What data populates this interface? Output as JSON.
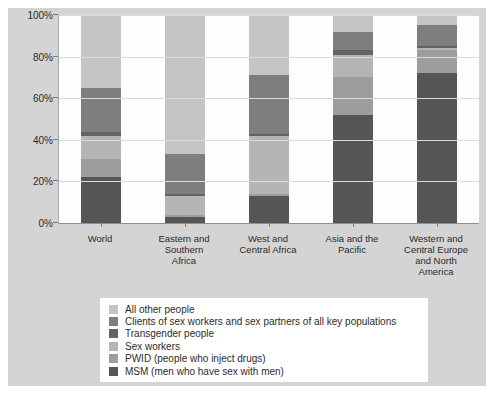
{
  "figure": {
    "background": "#d4d4d4",
    "plot_background": "#fdfdfd",
    "gridline_color": "#dcdcdc",
    "axis_color": "#8f8f8f",
    "text_color": "#2b2b2b",
    "legend_background": "#ffffff"
  },
  "chart_data": {
    "type": "bar",
    "subtype": "stacked-100-percent",
    "title": "",
    "xlabel": "",
    "ylabel": "",
    "ylim": [
      0,
      100
    ],
    "grid": true,
    "legend_position": "bottom",
    "y_ticks": [
      "0%",
      "20%",
      "40%",
      "60%",
      "80%",
      "100%"
    ],
    "categories": [
      "World",
      "Eastern and\nSouthern\nAfrica",
      "West and\nCentral Africa",
      "Asia and the\nPacific",
      "Western and\nCentral Europe\nand North\nAmerica"
    ],
    "stack_order": "bottom-to-top",
    "series": [
      {
        "name": "MSM (men who have sex with men)",
        "color": "#565656",
        "values": [
          22,
          3,
          13,
          52,
          72
        ]
      },
      {
        "name": "PWID (people who inject drugs)",
        "color": "#9d9d9d",
        "values": [
          9,
          1,
          1,
          18,
          11
        ]
      },
      {
        "name": "Sex workers",
        "color": "#b5b5b5",
        "values": [
          11,
          9,
          28,
          11,
          1
        ]
      },
      {
        "name": "Transgender people",
        "color": "#646464",
        "values": [
          2,
          1,
          1,
          2,
          1
        ]
      },
      {
        "name": "Clients of sex workers and sex partners of all key populations",
        "color": "#7e7e7e",
        "values": [
          21,
          19,
          28,
          9,
          10
        ]
      },
      {
        "name": "All other people",
        "color": "#c4c4c4",
        "values": [
          35,
          67,
          29,
          8,
          5
        ]
      }
    ],
    "legend_order_top_to_bottom": [
      "All other people",
      "Clients of sex workers and sex partners of all key populations",
      "Transgender people",
      "Sex workers",
      "PWID (people who inject drugs)",
      "MSM (men who have sex with men)"
    ]
  }
}
